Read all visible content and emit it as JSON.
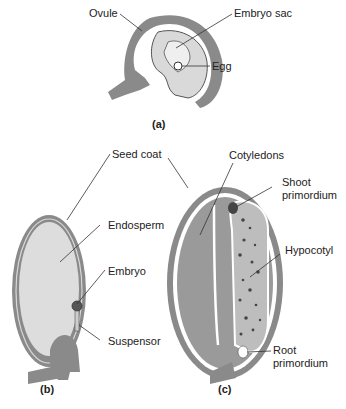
{
  "colors": {
    "tissue_dark": "#8a8a8a",
    "tissue_light": "#d9d9d9",
    "cotyledon": "#9a9a9a",
    "hypocotyl": "#bdbdbd",
    "line": "#333333"
  },
  "panel_a": {
    "caption": "(a)",
    "labels": {
      "ovule": "Ovule",
      "embryo_sac": "Embryo sac",
      "egg": "Egg"
    }
  },
  "panel_b": {
    "caption": "(b)",
    "labels": {
      "seed_coat": "Seed coat",
      "endosperm": "Endosperm",
      "embryo": "Embryo",
      "suspensor": "Suspensor"
    }
  },
  "panel_c": {
    "caption": "(c)",
    "labels": {
      "cotyledons": "Cotyledons",
      "shoot1": "Shoot",
      "shoot2": "primordium",
      "hypocotyl": "Hypocotyl",
      "root1": "Root",
      "root2": "primordium"
    }
  }
}
